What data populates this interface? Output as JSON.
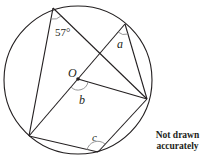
{
  "diagram": {
    "type": "circle-theorem",
    "circle": {
      "cx": 78,
      "cy": 80,
      "r": 74
    },
    "points": {
      "top_left": [
        53,
        8
      ],
      "top_right": [
        125,
        24
      ],
      "right": [
        147,
        99
      ],
      "bottom": [
        98,
        152
      ],
      "left": [
        29,
        136
      ],
      "center": [
        78,
        79
      ]
    },
    "labels": {
      "angle_57": "57°",
      "angle_a": "a",
      "angle_b": "b",
      "angle_c": "c",
      "center": "O"
    },
    "note": {
      "line1": "Not drawn",
      "line2": "accurately"
    },
    "colors": {
      "stroke": "#231f20",
      "arc": "#8a8a8a"
    }
  }
}
